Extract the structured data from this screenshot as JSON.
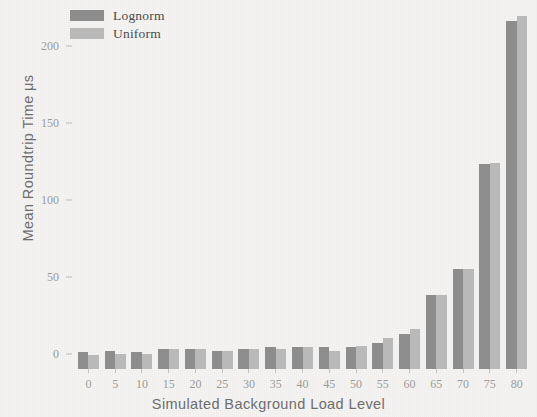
{
  "chart_data": {
    "type": "bar",
    "title": "",
    "xlabel": "Simulated Background Load Level",
    "ylabel": "Mean Roundtrip Time μs",
    "categories": [
      "0",
      "5",
      "10",
      "15",
      "20",
      "25",
      "30",
      "35",
      "40",
      "45",
      "50",
      "55",
      "60",
      "65",
      "70",
      "75",
      "80"
    ],
    "series": [
      {
        "name": "Lognorm",
        "color": "#8d8d8d",
        "values": [
          11,
          12,
          11,
          13,
          13,
          12,
          13,
          14,
          14,
          14,
          14,
          17,
          23,
          48,
          65,
          133,
          226
        ]
      },
      {
        "name": "Uniform",
        "color": "#b9b9b9",
        "values": [
          9,
          10,
          10,
          13,
          13,
          12,
          13,
          13,
          14,
          12,
          15,
          20,
          26,
          48,
          65,
          134,
          229
        ]
      }
    ],
    "ylim": [
      0,
      233
    ],
    "yticks": [
      0,
      50,
      100,
      150,
      200
    ],
    "ytick_labels": [
      "0",
      "50",
      "100",
      "150",
      "200"
    ],
    "grid": false,
    "legend_position": "top-left"
  },
  "legend": {
    "items": [
      {
        "label": "Lognorm",
        "color": "#8d8d8d"
      },
      {
        "label": "Uniform",
        "color": "#b9b9b9"
      }
    ]
  },
  "colors": {
    "background": "#f6f4f3",
    "lognorm": "#8d8d8d",
    "uniform": "#b9b9b9",
    "axis_text": "#9b9b9b",
    "axis_title": "#6d6d6d",
    "legend_text": "#4b4b4b"
  }
}
